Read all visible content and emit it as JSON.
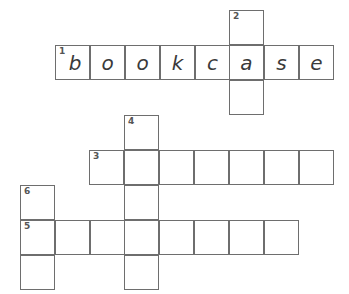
{
  "puzzle": {
    "title": "Crossword grid",
    "cell_size": 35,
    "grid_color": "#6e6e6e",
    "background": "#ffffff",
    "letter_color": "#3a3a3a",
    "number_color": "#555555",
    "entries": [
      {
        "number": "1",
        "direction": "across",
        "length": 8,
        "answer": "bookcase",
        "filled": true,
        "x": 55,
        "y": 45,
        "letters": [
          "b",
          "o",
          "o",
          "k",
          "c",
          "a",
          "s",
          "e"
        ]
      },
      {
        "number": "2",
        "direction": "down",
        "length": 3,
        "answer": "",
        "filled": false,
        "x": 229,
        "y": 10,
        "letters": [
          "",
          "",
          ""
        ]
      },
      {
        "number": "3",
        "direction": "across",
        "length": 7,
        "answer": "",
        "filled": false,
        "x": 89,
        "y": 150,
        "letters": [
          "",
          "",
          "",
          "",
          "",
          "",
          ""
        ]
      },
      {
        "number": "4",
        "direction": "down",
        "length": 5,
        "answer": "",
        "filled": false,
        "x": 124,
        "y": 115,
        "letters": [
          "",
          "",
          "",
          "",
          ""
        ]
      },
      {
        "number": "5",
        "direction": "across",
        "length": 8,
        "answer": "",
        "filled": false,
        "x": 20,
        "y": 220,
        "letters": [
          "",
          "",
          "",
          "",
          "",
          "",
          "",
          ""
        ]
      },
      {
        "number": "6",
        "direction": "down",
        "length": 3,
        "answer": "",
        "filled": false,
        "x": 20,
        "y": 185,
        "letters": [
          "",
          "",
          ""
        ]
      }
    ],
    "cells": [
      {
        "id": "r1c1",
        "x": 55,
        "y": 45,
        "number": "1",
        "letter": "b"
      },
      {
        "id": "r1c2",
        "x": 90,
        "y": 45,
        "number": "",
        "letter": "o"
      },
      {
        "id": "r1c3",
        "x": 125,
        "y": 45,
        "number": "",
        "letter": "o"
      },
      {
        "id": "r1c4",
        "x": 160,
        "y": 45,
        "number": "",
        "letter": "k"
      },
      {
        "id": "r1c5",
        "x": 195,
        "y": 45,
        "number": "",
        "letter": "c"
      },
      {
        "id": "r1c6",
        "x": 229,
        "y": 45,
        "number": "",
        "letter": "a"
      },
      {
        "id": "r1c7",
        "x": 264,
        "y": 45,
        "number": "",
        "letter": "s"
      },
      {
        "id": "r1c8",
        "x": 299,
        "y": 45,
        "number": "",
        "letter": "e"
      },
      {
        "id": "d2r1",
        "x": 229,
        "y": 10,
        "number": "2",
        "letter": ""
      },
      {
        "id": "d2r3",
        "x": 229,
        "y": 80,
        "number": "",
        "letter": ""
      },
      {
        "id": "d4r1",
        "x": 124,
        "y": 115,
        "number": "4",
        "letter": ""
      },
      {
        "id": "r3c1",
        "x": 89,
        "y": 150,
        "number": "3",
        "letter": ""
      },
      {
        "id": "r3c2",
        "x": 124,
        "y": 150,
        "number": "",
        "letter": ""
      },
      {
        "id": "r3c3",
        "x": 159,
        "y": 150,
        "number": "",
        "letter": ""
      },
      {
        "id": "r3c4",
        "x": 194,
        "y": 150,
        "number": "",
        "letter": ""
      },
      {
        "id": "r3c5",
        "x": 229,
        "y": 150,
        "number": "",
        "letter": ""
      },
      {
        "id": "r3c6",
        "x": 264,
        "y": 150,
        "number": "",
        "letter": ""
      },
      {
        "id": "r3c7",
        "x": 299,
        "y": 150,
        "number": "",
        "letter": ""
      },
      {
        "id": "d6r1",
        "x": 20,
        "y": 185,
        "number": "6",
        "letter": ""
      },
      {
        "id": "d4r2",
        "x": 124,
        "y": 185,
        "number": "",
        "letter": ""
      },
      {
        "id": "r5c1",
        "x": 20,
        "y": 220,
        "number": "5",
        "letter": ""
      },
      {
        "id": "r5c2",
        "x": 55,
        "y": 220,
        "number": "",
        "letter": ""
      },
      {
        "id": "r5c3",
        "x": 90,
        "y": 220,
        "number": "",
        "letter": ""
      },
      {
        "id": "r5c4",
        "x": 124,
        "y": 220,
        "number": "",
        "letter": ""
      },
      {
        "id": "r5c5",
        "x": 159,
        "y": 220,
        "number": "",
        "letter": ""
      },
      {
        "id": "r5c6",
        "x": 194,
        "y": 220,
        "number": "",
        "letter": ""
      },
      {
        "id": "r5c7",
        "x": 229,
        "y": 220,
        "number": "",
        "letter": ""
      },
      {
        "id": "r5c8",
        "x": 264,
        "y": 220,
        "number": "",
        "letter": ""
      },
      {
        "id": "d6r3",
        "x": 20,
        "y": 255,
        "number": "",
        "letter": ""
      },
      {
        "id": "d4r5",
        "x": 124,
        "y": 255,
        "number": "",
        "letter": ""
      }
    ]
  }
}
